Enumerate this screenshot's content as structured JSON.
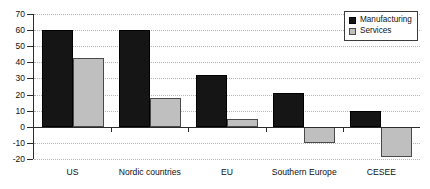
{
  "chart_data": {
    "type": "bar",
    "title": "",
    "subtitle": "",
    "xlabel": "",
    "ylabel": "",
    "categories": [
      "US",
      "Nordic countries",
      "EU",
      "Southern Europe",
      "CESEE"
    ],
    "series": [
      {
        "name": "Manufacturing",
        "color": "#151515",
        "values": [
          60,
          60,
          32,
          21,
          10
        ]
      },
      {
        "name": "Services",
        "color": "#bfbfbf",
        "values": [
          43,
          18,
          5,
          -10,
          -19
        ]
      }
    ],
    "ylim": [
      -20,
      70
    ],
    "yticks": [
      -20,
      -10,
      0,
      10,
      20,
      30,
      40,
      50,
      60,
      70
    ],
    "ytick_labels": [
      "-20",
      "-10",
      "0",
      "10",
      "20",
      "30",
      "40",
      "50",
      "60",
      "70"
    ],
    "grid": true,
    "grid_style": "dotted-horizontal",
    "legend_position": "top-right",
    "zero_line": 0
  },
  "legend": {
    "items": [
      {
        "label": "Manufacturing",
        "swatch": "manufacturing-swatch"
      },
      {
        "label": "Services",
        "swatch": "services-swatch"
      }
    ]
  }
}
